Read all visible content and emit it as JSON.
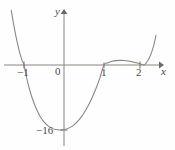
{
  "figure": {
    "kind": "cartesian-graph",
    "width": 175,
    "height": 150,
    "background": "#fefefe",
    "curve_color": "#8a827b",
    "axis_color": "#8a847e",
    "label_color": "#4a4a4a"
  },
  "labels": {
    "y_axis": "y",
    "x_axis": "x",
    "origin": "0",
    "x_neg1": "−1",
    "x_1": "1",
    "x_2": "2",
    "y_min": "−16"
  },
  "chart_data": {
    "type": "line",
    "title": "",
    "xlabel": "x",
    "ylabel": "y",
    "xlim": [
      -1.35,
      2.35
    ],
    "ylim": [
      -20,
      14
    ],
    "grid": false,
    "legend": null,
    "axis_origin_px": [
      64,
      65
    ],
    "x_ticks": [
      -1,
      1,
      2
    ],
    "x_tick_labels": [
      "−1",
      "1",
      "2"
    ],
    "y_ticks": [
      -16
    ],
    "y_tick_labels": [
      "−16"
    ],
    "annotations": [
      {
        "text": "−16",
        "x": -0.25,
        "y": -16,
        "note": "minimum value label on y-axis"
      }
    ],
    "roots": [
      -1,
      1,
      2
    ],
    "minimum": {
      "x": 0.1,
      "y": -16
    },
    "local_maximum": {
      "x": 1.55,
      "y": 1.1
    },
    "series": [
      {
        "name": "f(x)",
        "x": [
          -1.32,
          -1.28,
          -1.24,
          -1.2,
          -1.16,
          -1.12,
          -1.08,
          -1.04,
          -1.0,
          -0.9,
          -0.8,
          -0.7,
          -0.6,
          -0.5,
          -0.4,
          -0.3,
          -0.2,
          -0.1,
          0.0,
          0.1,
          0.2,
          0.3,
          0.4,
          0.5,
          0.6,
          0.7,
          0.8,
          0.9,
          1.0,
          1.1,
          1.2,
          1.3,
          1.4,
          1.5,
          1.6,
          1.7,
          1.8,
          1.9,
          2.0,
          2.05,
          2.1,
          2.15,
          2.2,
          2.25,
          2.3
        ],
        "y": [
          13.5,
          11.2,
          9.0,
          7.0,
          5.2,
          3.5,
          2.1,
          0.9,
          0.0,
          -4.6,
          -8.0,
          -10.6,
          -12.6,
          -14.0,
          -15.0,
          -15.6,
          -15.9,
          -16.0,
          -15.9,
          -15.6,
          -15.1,
          -14.3,
          -13.2,
          -11.8,
          -10.1,
          -8.1,
          -5.8,
          -3.1,
          0.0,
          0.55,
          0.9,
          1.08,
          1.14,
          1.1,
          0.97,
          0.78,
          0.55,
          0.3,
          0.0,
          0.45,
          1.15,
          2.1,
          3.4,
          5.1,
          7.3
        ]
      }
    ]
  }
}
